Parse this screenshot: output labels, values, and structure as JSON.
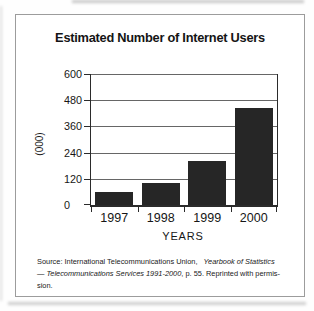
{
  "chart_data": {
    "type": "bar",
    "title": "Estimated Number of Internet Users",
    "categories": [
      "1997",
      "1998",
      "1999",
      "2000"
    ],
    "values": [
      60,
      100,
      200,
      445
    ],
    "xlabel": "YEARS",
    "ylabel": "(000)",
    "ylim": [
      0,
      600
    ],
    "yticks": [
      0,
      120,
      240,
      360,
      480,
      600
    ],
    "grid": true,
    "legend": false,
    "bar_color": "#262626",
    "axis_color": "#2b2b2b",
    "gridline_color": "#666666"
  },
  "source_note": {
    "line1_regular": "Source: International Telecommunications Union, ",
    "line1_italic": "Yearbook of Statistics",
    "line2_italic": "— Telecommunications Services 1991-2000",
    "line2_regular": ", p. 55. Reprinted with permis-",
    "line3": "sion."
  }
}
